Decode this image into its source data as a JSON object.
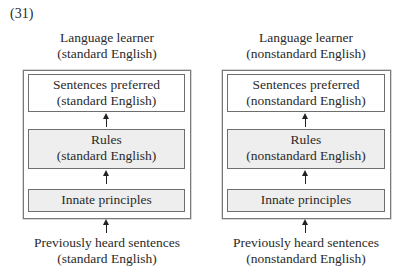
{
  "example_number": "(31)",
  "diagrams": [
    {
      "top_label": [
        "Language learner",
        "(standard English)"
      ],
      "output_box": [
        "Sentences preferred",
        "(standard English)"
      ],
      "rules_box": [
        "Rules",
        "(standard English)"
      ],
      "principles_box": "Innate principles",
      "input_label": [
        "Previously heard sentences",
        "(standard English)"
      ]
    },
    {
      "top_label": [
        "Language learner",
        "(nonstandard English)"
      ],
      "output_box": [
        "Sentences preferred",
        "(nonstandard English)"
      ],
      "rules_box": [
        "Rules",
        "(nonstandard English)"
      ],
      "principles_box": "Innate principles",
      "input_label": [
        "Previously heard sentences",
        "(nonstandard English)"
      ]
    }
  ]
}
